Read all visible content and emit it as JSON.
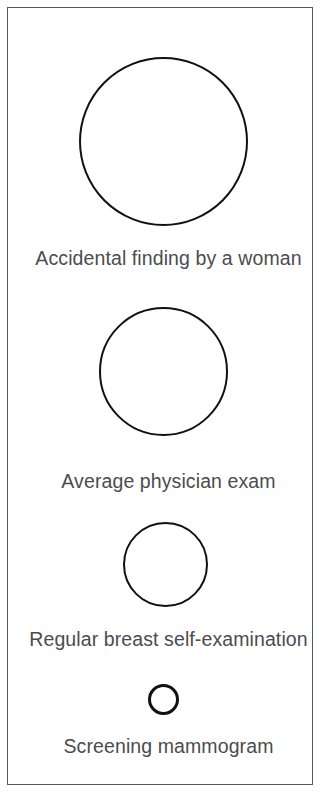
{
  "figure": {
    "background_color": "#ffffff",
    "frame_color": "#55595c",
    "circle_stroke_color": "#111111",
    "label_color": "#4c4c4e"
  },
  "chart_data": {
    "type": "bubble",
    "title": "",
    "subtitle": "",
    "xlabel": "",
    "ylabel": "",
    "legend": [],
    "grid": false,
    "orientation": "vertical-stack",
    "value_unit": "diameter_px",
    "categories": [
      "Accidental finding by a woman",
      "Average physician exam",
      "Regular breast self-examination",
      "Screening mammogram"
    ],
    "values": [
      169,
      129,
      85,
      31
    ],
    "items": [
      {
        "label": "Accidental finding by a woman",
        "diameter": 169,
        "center_x": 162,
        "center_y": 140,
        "stroke_width": 2.2,
        "rank": 1
      },
      {
        "label": "Average physician exam",
        "diameter": 129,
        "center_x": 162,
        "center_y": 370,
        "stroke_width": 2.4,
        "rank": 2
      },
      {
        "label": "Regular breast self-examination",
        "diameter": 85,
        "center_x": 164,
        "center_y": 563,
        "stroke_width": 2.8,
        "rank": 3
      },
      {
        "label": "Screening mammogram",
        "diameter": 31,
        "center_x": 162,
        "center_y": 698,
        "stroke_width": 3.2,
        "rank": 4
      }
    ]
  }
}
